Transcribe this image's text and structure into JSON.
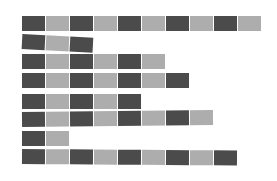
{
  "colors": {
    "dark": "#4b4b4b",
    "light": "#adadad",
    "background": "#ffffff"
  },
  "chart_data": {
    "type": "bar",
    "title": "",
    "categories": [
      "row1",
      "row2",
      "row3",
      "row4",
      "row5",
      "row6",
      "row7",
      "row8"
    ],
    "values": [
      10,
      3,
      6,
      7,
      5,
      8,
      2,
      9
    ],
    "xlabel": "",
    "ylabel": "",
    "note": "Each row is a horizontal stack of blocks alternating dark/light, starting dark"
  },
  "rows": [
    {
      "count": 10,
      "top": 16,
      "tilt": 0
    },
    {
      "count": 3,
      "top": 34,
      "tilt": 3
    },
    {
      "count": 6,
      "top": 54,
      "tilt": 0
    },
    {
      "count": 7,
      "top": 73,
      "tilt": 0
    },
    {
      "count": 5,
      "top": 94,
      "tilt": 0
    },
    {
      "count": 8,
      "top": 112,
      "tilt": -0.6
    },
    {
      "count": 2,
      "top": 131,
      "tilt": 0
    },
    {
      "count": 9,
      "top": 149,
      "tilt": 0.4
    }
  ]
}
